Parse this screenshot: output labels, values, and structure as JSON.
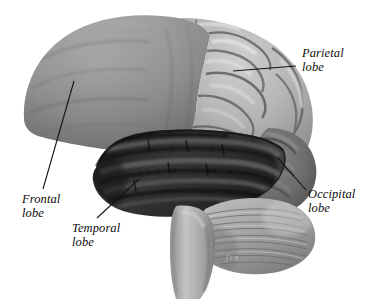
{
  "figure": {
    "background_color": "#ffffff",
    "width": 371,
    "height": 301
  },
  "labels": [
    {
      "id": "parietal",
      "text": "Parietal\nlobe",
      "name": "parietal-lobe-label",
      "leader_line": {
        "x1": 296,
        "y1": 66,
        "x2": 233,
        "y2": 71
      }
    },
    {
      "id": "occipital",
      "text": "Occipital\nlobe",
      "name": "occipital-lobe-label",
      "leader_line": {
        "x1": 306,
        "y1": 190,
        "x2": 277,
        "y2": 157
      }
    },
    {
      "id": "frontal",
      "text": "Frontal\nlobe",
      "name": "frontal-lobe-label",
      "leader_line": {
        "x1": 43,
        "y1": 189,
        "x2": 74,
        "y2": 81
      }
    },
    {
      "id": "temporal",
      "text": "Temporal\nlobe",
      "name": "temporal-lobe-label",
      "leader_line": {
        "x1": 97,
        "y1": 218,
        "x2": 139,
        "y2": 179
      }
    }
  ],
  "signature": {
    "text": "ʃɛʙ"
  },
  "regions": {
    "frontal_lobe": {
      "name": "frontal-lobe",
      "fill": "#8e8e8e"
    },
    "parietal_lobe": {
      "name": "parietal-lobe",
      "fill": "#b4b4b4"
    },
    "temporal_lobe": {
      "name": "temporal-lobe",
      "fill": "#2e2e2e"
    },
    "occipital_lobe": {
      "name": "occipital-lobe",
      "fill": "#6a6a6a"
    },
    "cerebellum": {
      "name": "cerebellum",
      "fill": "#a0a0a0"
    },
    "brainstem": {
      "name": "brainstem",
      "fill": "#b0b0b0"
    }
  },
  "colors": {
    "leader_line": "#141414",
    "outline": "#5a5a5a"
  }
}
